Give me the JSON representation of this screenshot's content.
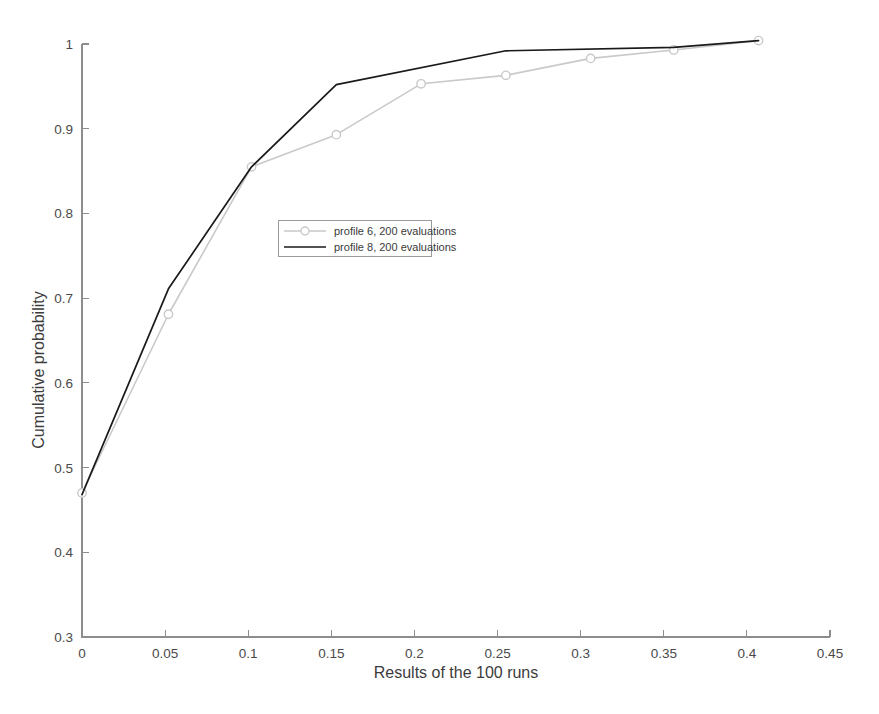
{
  "chart_data": {
    "type": "line",
    "title": "",
    "subtitle": "",
    "xlabel": "Results of the 100 runs",
    "ylabel": "Cumulative probability",
    "xlim": [
      0,
      0.45
    ],
    "ylim": [
      0.3,
      1.0
    ],
    "xticks": [
      0,
      0.05,
      0.1,
      0.15,
      0.2,
      0.25,
      0.3,
      0.35,
      0.4,
      0.45
    ],
    "xtick_labels": [
      "0",
      "0.05",
      "0.1",
      "0.15",
      "0.2",
      "0.25",
      "0.3",
      "0.35",
      "0.4",
      "0.45"
    ],
    "yticks": [
      0.3,
      0.4,
      0.5,
      0.6,
      0.7,
      0.8,
      0.9,
      1.0
    ],
    "ytick_labels": [
      "0.3",
      "0.4",
      "0.5",
      "0.6",
      "0.7",
      "0.8",
      "0.9",
      "1"
    ],
    "grid": false,
    "legend_position": "center-left",
    "series": [
      {
        "name": "profile 6, 200 evaluations",
        "color": "#c9c9c9",
        "marker": "circle",
        "has_markers": true,
        "linewidth": 1.6,
        "points": [
          {
            "x": 0.0,
            "y": 0.47
          },
          {
            "x": 0.052,
            "y": 0.681
          },
          {
            "x": 0.102,
            "y": 0.855
          },
          {
            "x": 0.153,
            "y": 0.893
          },
          {
            "x": 0.204,
            "y": 0.953
          },
          {
            "x": 0.255,
            "y": 0.963
          },
          {
            "x": 0.306,
            "y": 0.983
          },
          {
            "x": 0.356,
            "y": 0.993
          },
          {
            "x": 0.407,
            "y": 1.004
          }
        ]
      },
      {
        "name": "profile 8, 200 evaluations",
        "color": "#1a1a1a",
        "marker": "none",
        "has_markers": false,
        "linewidth": 1.7,
        "points": [
          {
            "x": 0.0,
            "y": 0.468
          },
          {
            "x": 0.052,
            "y": 0.711
          },
          {
            "x": 0.102,
            "y": 0.855
          },
          {
            "x": 0.153,
            "y": 0.952
          },
          {
            "x": 0.255,
            "y": 0.992
          },
          {
            "x": 0.356,
            "y": 0.996
          },
          {
            "x": 0.407,
            "y": 1.004
          }
        ]
      }
    ],
    "legend_entries": [
      {
        "label": "profile 6, 200 evaluations",
        "color": "#c9c9c9",
        "marker": "circle"
      },
      {
        "label": "profile 8, 200 evaluations",
        "color": "#1a1a1a",
        "marker": "none"
      }
    ]
  },
  "axes": {
    "x_title": "Results of the 100 runs",
    "y_title": "Cumulative probability"
  },
  "legend": {
    "entry_0_label": "profile 6, 200 evaluations",
    "entry_1_label": "profile 8, 200 evaluations"
  },
  "colors": {
    "series_profile6": "#c9c9c9",
    "series_profile8": "#1a1a1a",
    "axis": "#8d8d8d",
    "text": "#3c3c3c",
    "background": "#ffffff"
  }
}
